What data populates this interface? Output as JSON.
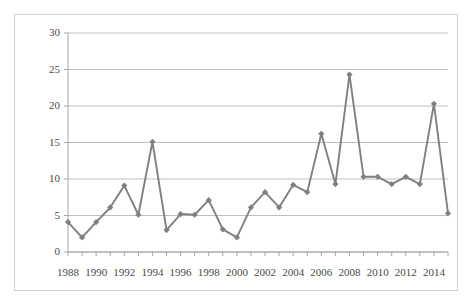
{
  "chart_data": {
    "type": "line",
    "title": "",
    "subtitle": "",
    "xlabel": "",
    "ylabel": "",
    "grid": true,
    "legend": false,
    "legend_position": "none",
    "series_color": "#808080",
    "marker": "diamond",
    "ylim": [
      0,
      30
    ],
    "yticks": [
      0,
      5,
      10,
      15,
      20,
      25,
      30
    ],
    "ytick_labels": [
      "0",
      "5",
      "10",
      "15",
      "20",
      "25",
      "30"
    ],
    "xlim": [
      1988,
      2015
    ],
    "xticks": [
      1988,
      1990,
      1992,
      1994,
      1996,
      1998,
      2000,
      2002,
      2004,
      2006,
      2008,
      2010,
      2012,
      2014
    ],
    "xtick_labels": [
      "1988",
      "1990",
      "1992",
      "1994",
      "1996",
      "1998",
      "2000",
      "2002",
      "2004",
      "2006",
      "2008",
      "2010",
      "2012",
      "2014"
    ],
    "x": [
      1988,
      1989,
      1990,
      1991,
      1992,
      1993,
      1994,
      1995,
      1996,
      1997,
      1998,
      1999,
      2000,
      2001,
      2002,
      2003,
      2004,
      2005,
      2006,
      2007,
      2008,
      2009,
      2010,
      2011,
      2012,
      2013,
      2014,
      2015
    ],
    "values": [
      4.1,
      2.0,
      4.1,
      6.1,
      9.1,
      5.1,
      15.1,
      3.0,
      5.2,
      5.1,
      7.1,
      3.1,
      2.0,
      6.1,
      8.2,
      6.1,
      9.2,
      8.2,
      16.2,
      9.3,
      24.3,
      10.3,
      10.3,
      9.3,
      10.3,
      9.3,
      20.3,
      5.3
    ],
    "series": [
      {
        "name": "series-1",
        "values": [
          4.1,
          2.0,
          4.1,
          6.1,
          9.1,
          5.1,
          15.1,
          3.0,
          5.2,
          5.1,
          7.1,
          3.1,
          2.0,
          6.1,
          8.2,
          6.1,
          9.2,
          8.2,
          16.2,
          9.3,
          24.3,
          10.3,
          10.3,
          9.3,
          10.3,
          9.3,
          20.3,
          5.3
        ]
      }
    ]
  },
  "style": {
    "grid_color": "#b8b8b8",
    "axis_color": "#a6a6a6",
    "frame_color": "#d2d2d2",
    "text_color": "#4a4a4a",
    "background": "#ffffff"
  }
}
